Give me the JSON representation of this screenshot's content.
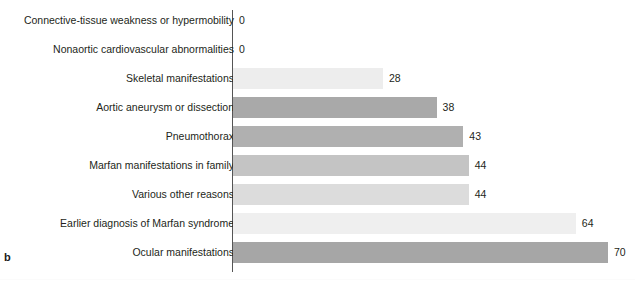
{
  "panel": {
    "label": "b"
  },
  "chart_data": {
    "type": "bar",
    "orientation": "horizontal",
    "title": "",
    "subtitle": "",
    "xlabel": "",
    "ylabel": "",
    "xlim": [
      0,
      70
    ],
    "grid": false,
    "legend": false,
    "value_labels": true,
    "categories": [
      "Connective-tissue weakness or hypermobility",
      "Nonaortic cardiovascular abnormalities",
      "Skeletal manifestations",
      "Aortic aneurysm or dissection",
      "Pneumothorax",
      "Marfan manifestations in family",
      "Various other reasons",
      "Earlier diagnosis of Marfan syndrome",
      "Ocular manifestations"
    ],
    "values": [
      0,
      0,
      28,
      38,
      43,
      44,
      44,
      64,
      70
    ],
    "bar_colors": [
      "#ffffff",
      "#ffffff",
      "#ededed",
      "#a9a9a9",
      "#b0b0b0",
      "#c4c4c4",
      "#dcdcdc",
      "#efefef",
      "#a6a6a6"
    ]
  },
  "colors": {
    "axis": "#555555",
    "text": "#231f20",
    "background": "#ffffff"
  }
}
